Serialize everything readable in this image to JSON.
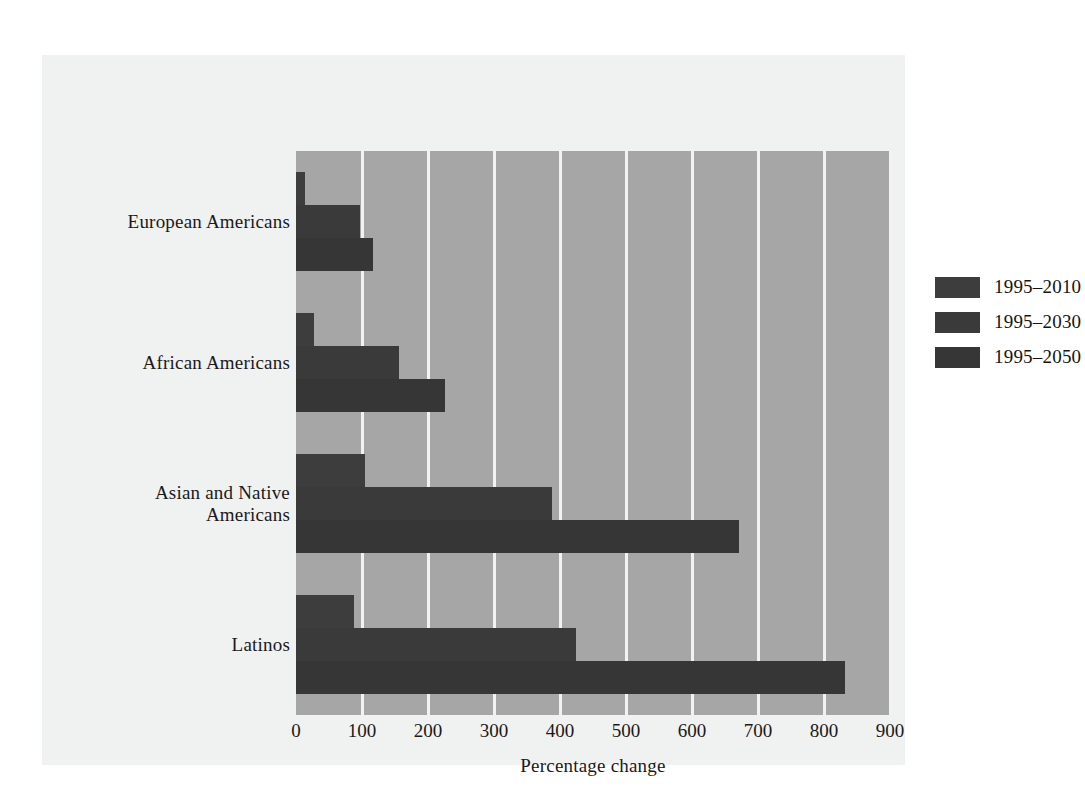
{
  "chart_data": {
    "type": "bar",
    "orientation": "horizontal",
    "title": "",
    "xlabel": "Percentage change",
    "ylabel": "",
    "xlim": [
      0,
      900
    ],
    "xticks": [
      0,
      100,
      200,
      300,
      400,
      500,
      600,
      700,
      800,
      900
    ],
    "grid": "vertical gridlines at every 100 units",
    "legend_position": "top-right inside plot",
    "categories": [
      "European Americans",
      "African Americans",
      "Asian and Native Americans",
      "Latinos"
    ],
    "category_lines": [
      [
        "European Americans"
      ],
      [
        "African Americans"
      ],
      [
        "Asian and Native",
        "Americans"
      ],
      [
        "Latinos"
      ]
    ],
    "series": [
      {
        "name": "1995–2010",
        "color": "#3d3d3d",
        "values": [
          14,
          27,
          105,
          88
        ]
      },
      {
        "name": "1995–2030",
        "color": "#3a3a3a",
        "values": [
          97,
          156,
          388,
          424
        ]
      },
      {
        "name": "1995–2050",
        "color": "#363636",
        "values": [
          117,
          226,
          671,
          832
        ]
      }
    ]
  },
  "colors": {
    "page_background": "#ffffff",
    "card_background": "#f0f1f1",
    "plot_background": "#a6a6a6",
    "gridline": "#f2f2f2",
    "bar_dark": "#3a3a3a",
    "text": "#1a1a1a"
  }
}
